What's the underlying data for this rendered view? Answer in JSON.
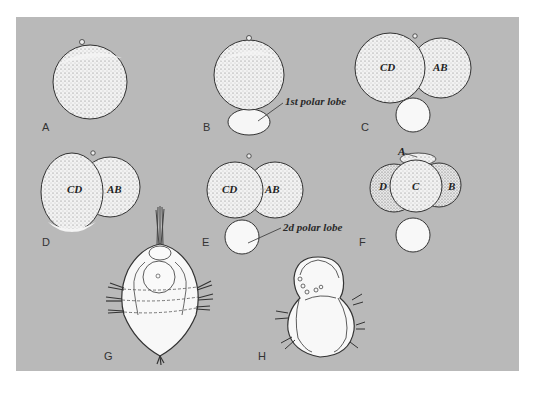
{
  "figure": {
    "background_color": "#b9b9b9",
    "panels": [
      {
        "id": "A",
        "label": "A"
      },
      {
        "id": "B",
        "label": "B",
        "annotation": "1st polar lobe"
      },
      {
        "id": "C",
        "label": "C",
        "cells": [
          "CD",
          "AB"
        ]
      },
      {
        "id": "D",
        "label": "D",
        "cells": [
          "CD",
          "AB"
        ]
      },
      {
        "id": "E",
        "label": "E",
        "cells": [
          "CD",
          "AB"
        ],
        "annotation": "2d polar lobe"
      },
      {
        "id": "F",
        "label": "F",
        "cells": [
          "A",
          "D",
          "C",
          "B"
        ]
      },
      {
        "id": "G",
        "label": "G"
      },
      {
        "id": "H",
        "label": "H"
      }
    ]
  }
}
